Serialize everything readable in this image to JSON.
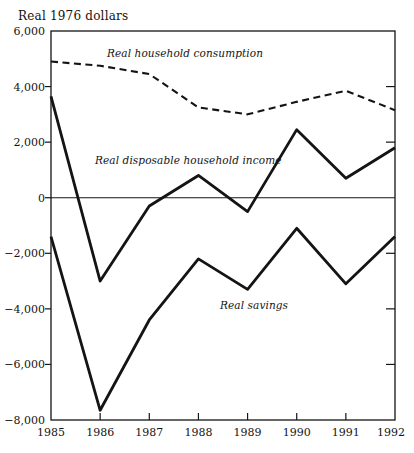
{
  "page": {
    "background": "#ffffff",
    "ink": "#141414"
  },
  "chart_data": {
    "type": "line",
    "title": "Real 1976 dollars",
    "xlabel": "",
    "ylabel": "Real 1976 dollars",
    "x": [
      1985,
      1986,
      1987,
      1988,
      1989,
      1990,
      1991,
      1992
    ],
    "series": [
      {
        "id": "consumption",
        "name": "Real household consumption",
        "line_style": "dashed",
        "values": [
          4900,
          4750,
          4450,
          3250,
          3000,
          3450,
          3850,
          3150
        ]
      },
      {
        "id": "income",
        "name": "Real disposable household income",
        "line_style": "solid",
        "values": [
          3650,
          -3000,
          -300,
          800,
          -500,
          2450,
          700,
          1800
        ]
      },
      {
        "id": "savings",
        "name": "Real savings",
        "line_style": "solid",
        "values": [
          -1400,
          -7650,
          -4400,
          -2200,
          -3300,
          -1100,
          -3100,
          -1400
        ]
      }
    ],
    "xlim": [
      1985,
      1992
    ],
    "ylim": [
      -8000,
      6000
    ],
    "yticks": [
      {
        "value": 6000,
        "label": "6,000"
      },
      {
        "value": 4000,
        "label": "4,000"
      },
      {
        "value": 2000,
        "label": "2,000"
      },
      {
        "value": 0,
        "label": "0"
      },
      {
        "value": -2000,
        "label": "−2,000"
      },
      {
        "value": -4000,
        "label": "−4,000"
      },
      {
        "value": -6000,
        "label": "−6,000"
      },
      {
        "value": -8000,
        "label": "−8,000"
      }
    ],
    "xticks": [
      {
        "value": 1985,
        "label": "1985"
      },
      {
        "value": 1986,
        "label": "1986"
      },
      {
        "value": 1987,
        "label": "1987"
      },
      {
        "value": 1988,
        "label": "1988"
      },
      {
        "value": 1989,
        "label": "1989"
      },
      {
        "value": 1990,
        "label": "1990"
      },
      {
        "value": 1991,
        "label": "1991"
      },
      {
        "value": 1992,
        "label": "1992"
      }
    ],
    "grid": "zero-baseline-only",
    "legend": "inline-labels",
    "annotations": [
      {
        "text": "Real household consumption",
        "x_px": 107,
        "y_px": 57
      },
      {
        "text": "Real disposable household income",
        "x_px": 95,
        "y_px": 164
      },
      {
        "text": "Real savings",
        "x_px": 220,
        "y_px": 309
      }
    ],
    "line_color": "#141414"
  }
}
